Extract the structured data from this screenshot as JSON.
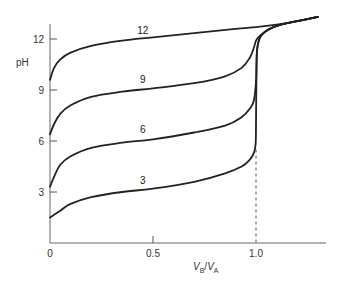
{
  "chart_data": {
    "type": "line",
    "title": "",
    "xlabel": "V_B/V_A",
    "xlabel_parts": {
      "v1": "V",
      "sub1": "B",
      "slash": "/",
      "v2": "V",
      "sub2": "A"
    },
    "ylabel": "pH",
    "xlim": [
      0,
      1.3
    ],
    "ylim": [
      0,
      13.5
    ],
    "x_ticks": [
      {
        "value": 0,
        "label": "0"
      },
      {
        "value": 0.5,
        "label": "0.5"
      },
      {
        "value": 1.0,
        "label": "1.0"
      }
    ],
    "y_ticks": [
      {
        "value": 3,
        "label": "3"
      },
      {
        "value": 6,
        "label": "6"
      },
      {
        "value": 9,
        "label": "9"
      },
      {
        "value": 12,
        "label": "12"
      }
    ],
    "grid": false,
    "legend": "inline labels on curves",
    "annotations": [
      {
        "type": "dashed-vertical-line",
        "x": 1.0,
        "y_from": 0,
        "y_to": 5.5,
        "meaning": "equivalence point"
      }
    ],
    "series": [
      {
        "name": "12",
        "label_at": {
          "x": 0.45,
          "y": 12.3
        },
        "x": [
          0,
          0.02,
          0.05,
          0.1,
          0.2,
          0.35,
          0.5,
          0.7,
          0.9,
          1.0,
          1.1,
          1.2,
          1.3
        ],
        "y": [
          9.6,
          10.3,
          10.8,
          11.2,
          11.6,
          11.9,
          12.1,
          12.35,
          12.6,
          12.7,
          12.85,
          13.05,
          13.3
        ]
      },
      {
        "name": "9",
        "label_at": {
          "x": 0.45,
          "y": 9.4
        },
        "x": [
          0,
          0.02,
          0.05,
          0.1,
          0.2,
          0.35,
          0.5,
          0.7,
          0.85,
          0.93,
          0.97,
          0.99,
          1.0,
          1.02,
          1.06,
          1.12,
          1.2,
          1.3
        ],
        "y": [
          6.4,
          7.0,
          7.6,
          8.1,
          8.6,
          8.9,
          9.1,
          9.4,
          9.8,
          10.3,
          10.9,
          11.5,
          11.9,
          12.2,
          12.55,
          12.85,
          13.05,
          13.3
        ]
      },
      {
        "name": "6",
        "label_at": {
          "x": 0.45,
          "y": 6.5
        },
        "x": [
          0,
          0.02,
          0.05,
          0.1,
          0.2,
          0.35,
          0.5,
          0.7,
          0.85,
          0.93,
          0.97,
          0.99,
          1.0,
          1.005,
          1.02,
          1.06,
          1.12,
          1.2,
          1.3
        ],
        "y": [
          3.3,
          3.9,
          4.6,
          5.1,
          5.6,
          5.9,
          6.1,
          6.5,
          6.9,
          7.4,
          7.9,
          8.4,
          9.5,
          11.3,
          12.1,
          12.55,
          12.85,
          13.05,
          13.3
        ]
      },
      {
        "name": "3",
        "label_at": {
          "x": 0.45,
          "y": 3.5
        },
        "x": [
          0,
          0.05,
          0.1,
          0.2,
          0.35,
          0.5,
          0.7,
          0.85,
          0.93,
          0.97,
          0.99,
          0.998,
          1.0,
          1.002,
          1.005,
          1.02,
          1.06,
          1.12,
          1.2,
          1.3
        ],
        "y": [
          1.5,
          1.9,
          2.3,
          2.7,
          3.0,
          3.2,
          3.6,
          4.1,
          4.5,
          4.9,
          5.3,
          5.8,
          7.0,
          9.5,
          11.3,
          12.1,
          12.55,
          12.85,
          13.05,
          13.3
        ]
      }
    ]
  },
  "layout": {
    "colors": {
      "curve": "#222222",
      "axis": "#555555",
      "dashed": "#555555",
      "background": "#ffffff"
    }
  }
}
